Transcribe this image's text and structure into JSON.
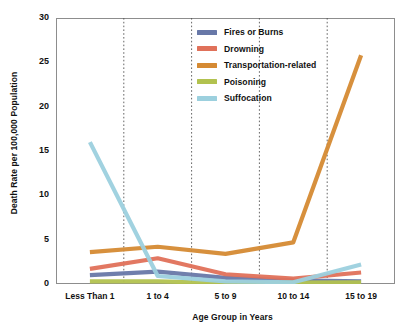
{
  "chart_data": {
    "type": "line",
    "title": "",
    "xlabel": "Age Group in Years",
    "ylabel": "Death Rate per 100,000 Population",
    "categories": [
      "Less Than 1",
      "1 to 4",
      "5 to 9",
      "10 to 14",
      "15 to 19"
    ],
    "ylim": [
      0,
      30
    ],
    "yticks": [
      0,
      5,
      10,
      15,
      20,
      25,
      30
    ],
    "ytick_labels": [
      "0",
      "5",
      "10",
      "15",
      "20",
      "25",
      "30"
    ],
    "grid": "vertical-dotted-between-categories",
    "legend_position": "inside upper-center",
    "series": [
      {
        "name": "Fires or Burns",
        "color": "#6878a8",
        "values": [
          1.0,
          1.4,
          0.7,
          0.4,
          0.3
        ]
      },
      {
        "name": "Drowning",
        "color": "#e0715a",
        "values": [
          1.7,
          2.9,
          1.1,
          0.6,
          1.3
        ]
      },
      {
        "name": "Transportation-related",
        "color": "#d58a33",
        "values": [
          3.6,
          4.2,
          3.4,
          4.7,
          25.8
        ]
      },
      {
        "name": "Poisoning",
        "color": "#b2c24f",
        "values": [
          0.3,
          0.3,
          0.1,
          0.15,
          0.2
        ]
      },
      {
        "name": "Suffocation",
        "color": "#9cd0de",
        "values": [
          16.0,
          0.9,
          0.3,
          0.2,
          2.2
        ]
      }
    ]
  },
  "axes": {
    "y_title": "Death Rate per 100,000 Population",
    "x_title": "Age Group in Years"
  }
}
